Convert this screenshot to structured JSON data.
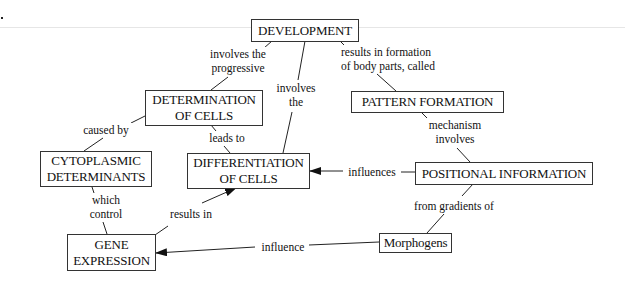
{
  "diagram": {
    "type": "concept-map",
    "marker": ".",
    "nodes": {
      "development": "DEVELOPMENT",
      "determination": "DETERMINATION\nOF CELLS",
      "pattern_formation": "PATTERN FORMATION",
      "cytoplasmic": "CYTOPLASMIC\nDETERMINANTS",
      "differentiation": "DIFFERENTIATION\nOF CELLS",
      "positional": "POSITIONAL INFORMATION",
      "gene_expression": "GENE\nEXPRESSION",
      "morphogens": "Morphogens"
    },
    "links": {
      "dev_to_determination": "involves the\nprogressive",
      "dev_to_differentiation": "involves\nthe",
      "dev_to_pattern": "results in formation\nof body parts, called",
      "determination_to_cytoplasmic": "caused by",
      "determination_to_differentiation": "leads to",
      "pattern_to_positional": "mechanism\ninvolves",
      "positional_to_differentiation": "influences",
      "cytoplasmic_to_gene": "which\ncontrol",
      "gene_to_differentiation": "results in",
      "positional_to_morphogens": "from gradients of",
      "morphogens_to_gene": "influence"
    }
  }
}
